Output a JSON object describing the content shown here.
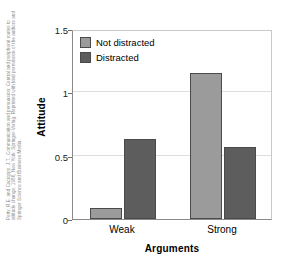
{
  "credit": {
    "text": "Petty, R.E. and Cacioppo, J.T., Communication and persuasion: Central and peripheral routes to attitude change, 1986, New York: Springer-Verlag. Reprinted with kind permission of the authors and Springer Science and Business Media."
  },
  "legend": {
    "position": "top-left-inside",
    "entries": [
      {
        "label": "Not distracted",
        "color": "#9b9b9b"
      },
      {
        "label": "Distracted",
        "color": "#5d5d5d"
      }
    ]
  },
  "axes": {
    "y_title": "Attitude",
    "x_title": "Arguments",
    "y_ticks": [
      "0",
      "0.5",
      "1",
      "1.5"
    ],
    "x_ticks": [
      "Weak",
      "Strong"
    ]
  },
  "chart_data": {
    "type": "bar",
    "title": "",
    "xlabel": "Arguments",
    "ylabel": "Attitude",
    "categories": [
      "Weak",
      "Strong"
    ],
    "series": [
      {
        "name": "Not distracted",
        "color": "#9b9b9b",
        "values": [
          0.09,
          1.15
        ]
      },
      {
        "name": "Distracted",
        "color": "#5d5d5d",
        "values": [
          0.63,
          0.57
        ]
      }
    ],
    "ylim": [
      0,
      1.5
    ],
    "yticks": [
      0,
      0.5,
      1,
      1.5
    ],
    "ytick_labels": [
      "0",
      "0.5",
      "1",
      "1.5"
    ],
    "grid": "horizontal",
    "legend_position": "upper left",
    "annotations": []
  }
}
